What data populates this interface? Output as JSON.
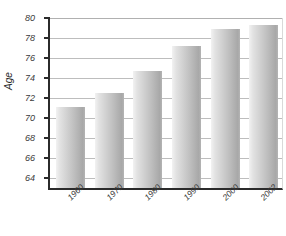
{
  "chart_data": {
    "type": "bar",
    "title": "",
    "subtitle": "",
    "xlabel": "",
    "ylabel": "Age",
    "categories": [
      "1960",
      "1970",
      "1980",
      "1990",
      "2000",
      "2002"
    ],
    "values": [
      71.1,
      72.5,
      74.7,
      77.2,
      78.9,
      79.3
    ],
    "ylim": [
      63,
      80
    ],
    "yticks": [
      64,
      66,
      68,
      70,
      72,
      74,
      76,
      78,
      80
    ],
    "ytick_labels": [
      "64",
      "66",
      "68",
      "70",
      "72",
      "74",
      "76",
      "78",
      "80"
    ],
    "grid": true,
    "legend": "none",
    "series": [
      {
        "name": "Age",
        "values": [
          71.1,
          72.5,
          74.7,
          77.2,
          78.9,
          79.3
        ]
      }
    ],
    "annotations": []
  },
  "style": {
    "bar_light": "#f2f2f2",
    "bar_dark": "#a8a8a8",
    "axis_color": "#2b2b2b",
    "grid_color": "#bdbdbd",
    "text_color": "#3a3a3a",
    "background": "#ffffff"
  }
}
